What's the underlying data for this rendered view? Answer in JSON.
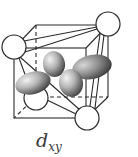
{
  "figure": {
    "orbital_label_main": "d",
    "orbital_label_sub": "xy",
    "colors": {
      "line": "#2b2b2b",
      "ligand_fill": "#ffffff",
      "lobe_light": "#e6e6e6",
      "lobe_dark": "#4a4a4a"
    },
    "ligands": [
      {
        "name": "top-left",
        "cx": 14,
        "cy": 47,
        "r": 12
      },
      {
        "name": "top-right",
        "cx": 108,
        "cy": 24,
        "r": 12
      },
      {
        "name": "bottom-left",
        "cx": 36,
        "cy": 98,
        "r": 12
      },
      {
        "name": "bottom-right",
        "cx": 87,
        "cy": 118,
        "r": 12
      }
    ]
  }
}
